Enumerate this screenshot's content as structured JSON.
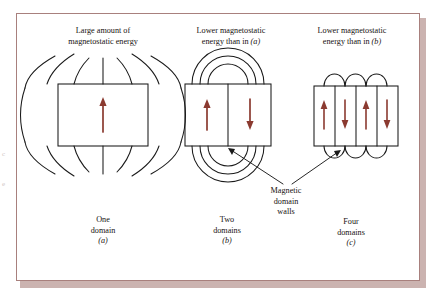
{
  "figure": {
    "colors": {
      "arrow": "#8B3A30",
      "line": "#1a1a1a",
      "frame_border": "#a8807d",
      "shadow": "#cbb3b0",
      "background": "#ffffff",
      "text": "#17120f"
    },
    "panels": [
      {
        "id": "a",
        "top_caption_line1": "Large amount of",
        "top_caption_line2": "magnetostatic energy",
        "bottom_label_line1": "One",
        "bottom_label_line2": "domain",
        "bottom_label_letter": "(a)",
        "domain_count": 1,
        "arrow_directions": [
          "up"
        ],
        "field_lines": "full external flux loops above and below"
      },
      {
        "id": "b",
        "top_caption_line1": "Lower magnetostatic",
        "top_caption_line2": "energy than in",
        "top_caption_ref": "(a)",
        "bottom_label_line1": "Two",
        "bottom_label_line2": "domains",
        "bottom_label_letter": "(b)",
        "domain_count": 2,
        "arrow_directions": [
          "up",
          "down"
        ],
        "field_lines": "three concentric closure arcs above and below"
      },
      {
        "id": "c",
        "top_caption_line1": "Lower magnetostatic",
        "top_caption_line2": "energy than in",
        "top_caption_ref": "(b)",
        "bottom_label_line1": "Four",
        "bottom_label_line2": "domains",
        "bottom_label_letter": "(c)",
        "domain_count": 4,
        "arrow_directions": [
          "up",
          "down",
          "up",
          "down"
        ],
        "field_lines": "three small closure loops above and below"
      }
    ],
    "annotation": {
      "line1": "Magnetic",
      "line2": "domain",
      "line3": "walls",
      "points_to": [
        "panel-b-domain-wall",
        "panel-c-domain-wall"
      ]
    },
    "margin_fragments": [
      "c",
      "e"
    ]
  }
}
